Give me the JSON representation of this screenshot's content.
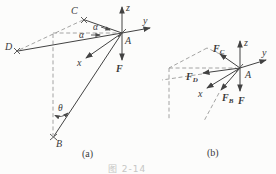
{
  "colors": {
    "ink": "#3a3a3a",
    "dashed_line": "#9a9a98",
    "caption": "#c6c6c4",
    "background": "#fcfcfb"
  },
  "caption": "图 2-14",
  "panel_a": {
    "tag": "(a)",
    "axes": {
      "x": "x",
      "y": "y",
      "z": "z"
    },
    "points": {
      "A": "A",
      "B": "B",
      "C": "C",
      "D": "D"
    },
    "force_F": "F",
    "angles": {
      "alpha_upper": "α",
      "alpha_lower": "α",
      "theta": "θ"
    }
  },
  "panel_b": {
    "tag": "(b)",
    "axes": {
      "x": "x",
      "y": "y",
      "z": "z"
    },
    "points": {
      "A": "A"
    },
    "force_F": "F",
    "forces": {
      "FC": {
        "base": "F",
        "sub": "C"
      },
      "FD": {
        "base": "F",
        "sub": "D"
      },
      "FB": {
        "base": "F",
        "sub": "B"
      }
    }
  }
}
